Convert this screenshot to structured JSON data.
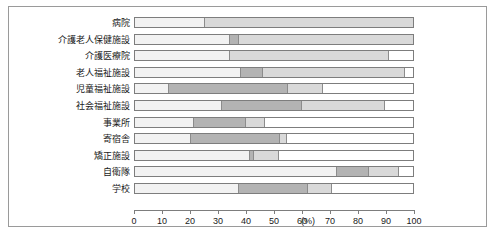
{
  "chart_data": {
    "type": "bar",
    "orientation": "horizontal",
    "stacked": true,
    "title": "",
    "xlabel": "(%)",
    "ylabel": "",
    "xlim": [
      0,
      100
    ],
    "xticks": [
      0,
      10,
      20,
      30,
      40,
      50,
      60,
      70,
      80,
      90,
      100
    ],
    "xtick_labels": [
      "0",
      "10",
      "20",
      "30",
      "40",
      "50",
      "60",
      "70",
      "80",
      "90",
      "100"
    ],
    "unit": "(%)",
    "grid": false,
    "legend": "none",
    "colors": {
      "segment_light": "#f2f2f2",
      "segment_mid": "#d9d9d9",
      "segment_dark": "#b3b3b3",
      "segment_empty": "#ffffff",
      "border": "#7d7d7d",
      "frame": "#9a9a9a"
    },
    "categories": [
      "病院",
      "介護老人保健施設",
      "介護医療院",
      "老人福祉施設",
      "児童福祉施設",
      "社会福祉施設",
      "事業所",
      "寄宿舎",
      "矯正施設",
      "自衛隊",
      "学校"
    ],
    "series": [
      {
        "name": "segment-1",
        "values": [
          25,
          34,
          34,
          38,
          12,
          31,
          21,
          20,
          41,
          72,
          37
        ]
      },
      {
        "name": "segment-2",
        "values": [
          75,
          3.5,
          57,
          8,
          43,
          29,
          19,
          32,
          2,
          12,
          25
        ]
      },
      {
        "name": "segment-3",
        "values": [
          0,
          62.5,
          0,
          51,
          13,
          30,
          7,
          3,
          9,
          11,
          9
        ]
      },
      {
        "name": "segment-4",
        "values": [
          0,
          0,
          9,
          3,
          32,
          10,
          53,
          45,
          48,
          5,
          29
        ]
      }
    ],
    "rows": [
      {
        "label": "病院",
        "segments": [
          {
            "value": 25,
            "shade": "light"
          },
          {
            "value": 75,
            "shade": "mid"
          },
          {
            "value": 0,
            "shade": "dark"
          },
          {
            "value": 0,
            "shade": "empty"
          }
        ]
      },
      {
        "label": "介護老人保健施設",
        "segments": [
          {
            "value": 34,
            "shade": "light"
          },
          {
            "value": 3.5,
            "shade": "dark"
          },
          {
            "value": 62.5,
            "shade": "mid"
          },
          {
            "value": 0,
            "shade": "empty"
          }
        ]
      },
      {
        "label": "介護医療院",
        "segments": [
          {
            "value": 34,
            "shade": "light"
          },
          {
            "value": 57,
            "shade": "mid"
          },
          {
            "value": 0,
            "shade": "dark"
          },
          {
            "value": 9,
            "shade": "empty"
          }
        ]
      },
      {
        "label": "老人福祉施設",
        "segments": [
          {
            "value": 38,
            "shade": "light"
          },
          {
            "value": 8,
            "shade": "dark"
          },
          {
            "value": 51,
            "shade": "mid"
          },
          {
            "value": 3,
            "shade": "empty"
          }
        ]
      },
      {
        "label": "児童福祉施設",
        "segments": [
          {
            "value": 12,
            "shade": "light"
          },
          {
            "value": 43,
            "shade": "dark"
          },
          {
            "value": 13,
            "shade": "mid"
          },
          {
            "value": 32,
            "shade": "empty"
          }
        ]
      },
      {
        "label": "社会福祉施設",
        "segments": [
          {
            "value": 31,
            "shade": "light"
          },
          {
            "value": 29,
            "shade": "dark"
          },
          {
            "value": 30,
            "shade": "mid"
          },
          {
            "value": 10,
            "shade": "empty"
          }
        ]
      },
      {
        "label": "事業所",
        "segments": [
          {
            "value": 21,
            "shade": "light"
          },
          {
            "value": 19,
            "shade": "dark"
          },
          {
            "value": 7,
            "shade": "mid"
          },
          {
            "value": 53,
            "shade": "empty"
          }
        ]
      },
      {
        "label": "寄宿舎",
        "segments": [
          {
            "value": 20,
            "shade": "light"
          },
          {
            "value": 32,
            "shade": "dark"
          },
          {
            "value": 3,
            "shade": "mid"
          },
          {
            "value": 45,
            "shade": "empty"
          }
        ]
      },
      {
        "label": "矯正施設",
        "segments": [
          {
            "value": 41,
            "shade": "light"
          },
          {
            "value": 2,
            "shade": "dark"
          },
          {
            "value": 9,
            "shade": "mid"
          },
          {
            "value": 48,
            "shade": "empty"
          }
        ]
      },
      {
        "label": "自衛隊",
        "segments": [
          {
            "value": 72,
            "shade": "light"
          },
          {
            "value": 12,
            "shade": "dark"
          },
          {
            "value": 11,
            "shade": "mid"
          },
          {
            "value": 5,
            "shade": "empty"
          }
        ]
      },
      {
        "label": "学校",
        "segments": [
          {
            "value": 37,
            "shade": "light"
          },
          {
            "value": 25,
            "shade": "dark"
          },
          {
            "value": 9,
            "shade": "mid"
          },
          {
            "value": 29,
            "shade": "empty"
          }
        ]
      }
    ]
  }
}
